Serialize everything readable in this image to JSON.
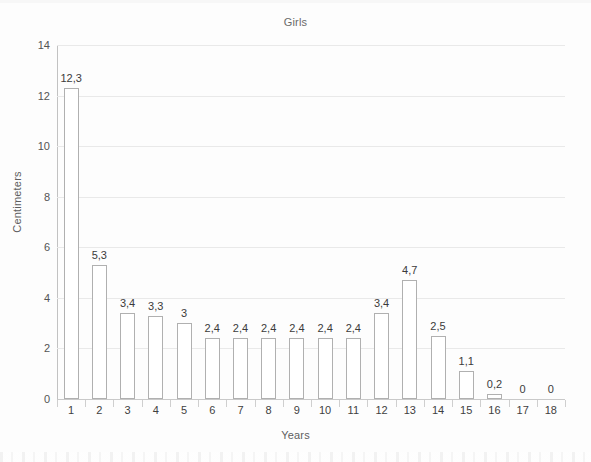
{
  "chart_data": {
    "type": "bar",
    "title": "Girls",
    "xlabel": "Years",
    "ylabel": "Centimeters",
    "categories": [
      "1",
      "2",
      "3",
      "4",
      "5",
      "6",
      "7",
      "8",
      "9",
      "10",
      "11",
      "12",
      "13",
      "14",
      "15",
      "16",
      "17",
      "18"
    ],
    "values": [
      12.3,
      5.3,
      3.4,
      3.3,
      3,
      2.4,
      2.4,
      2.4,
      2.4,
      2.4,
      2.4,
      3.4,
      4.7,
      2.5,
      1.1,
      0.2,
      0,
      0
    ],
    "value_labels": [
      "12,3",
      "5,3",
      "3,4",
      "3,3",
      "3",
      "2,4",
      "2,4",
      "2,4",
      "2,4",
      "2,4",
      "2,4",
      "3,4",
      "4,7",
      "2,5",
      "1,1",
      "0,2",
      "0",
      "0"
    ],
    "ylim": [
      0,
      14
    ],
    "yticks": [
      0,
      2,
      4,
      6,
      8,
      10,
      12,
      14
    ],
    "ytick_labels": [
      "0",
      "2",
      "4",
      "6",
      "8",
      "10",
      "12",
      "14"
    ],
    "grid": "horizontal",
    "legend": "none",
    "decimal_separator": ",",
    "bar_fill_color": "#ffffff",
    "bar_edge_color": "#b0b0b0",
    "gridline_color": "#e9e9e9",
    "axis_color": "#c2c2c2",
    "background_color": "#ffffff"
  }
}
